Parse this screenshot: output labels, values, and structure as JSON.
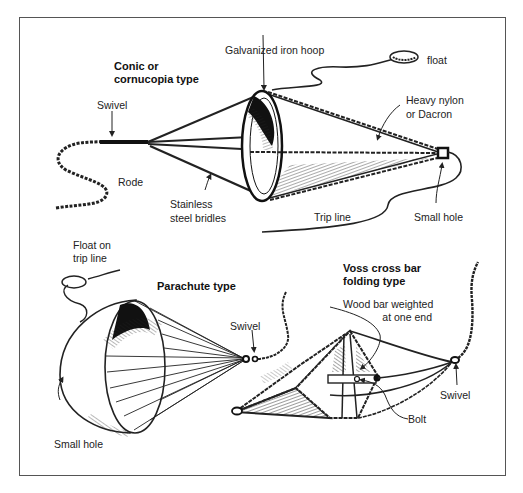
{
  "figure": {
    "sections": [
      {
        "title_line1": "Conic or",
        "title_line2": "cornucopia type",
        "labels": {
          "hoop": "Galvanized iron hoop",
          "float": "float",
          "swivel": "Swivel",
          "nylon_line1": "Heavy nylon",
          "nylon_line2": "or Dacron",
          "rode": "Rode",
          "bridles_line1": "Stainless",
          "bridles_line2": "steel bridles",
          "trip_line": "Trip line",
          "small_hole": "Small hole"
        }
      },
      {
        "title": "Parachute type",
        "labels": {
          "float_line1": "Float on",
          "float_line2": "trip line",
          "swivel": "Swivel",
          "small_hole": "Small hole"
        }
      },
      {
        "title_line1": "Voss cross bar",
        "title_line2": "folding type",
        "labels": {
          "wood_line1": "Wood bar weighted",
          "wood_line2": "at one end",
          "swivel": "Swivel",
          "bolt": "Bolt"
        }
      }
    ]
  },
  "colors": {
    "ink": "#1a1a1a",
    "frame": "#555555",
    "background": "#ffffff"
  }
}
